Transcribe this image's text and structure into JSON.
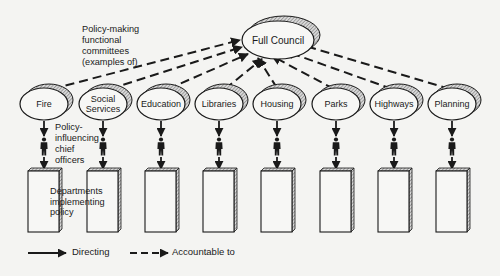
{
  "diagram": {
    "type": "organisation-chart",
    "council": {
      "label": "Full Council"
    },
    "committees_annotation": [
      "Policy-making",
      "functional",
      "committees",
      "(examples of)"
    ],
    "officers_annotation": [
      "Policy-",
      "influencing",
      "chief",
      "officers"
    ],
    "departments_annotation": [
      "Departments",
      "implementing",
      "policy"
    ],
    "committees": [
      {
        "label": "Fire",
        "lines": [
          "Fire"
        ]
      },
      {
        "label": "Social Services",
        "lines": [
          "Social",
          "Services"
        ]
      },
      {
        "label": "Education",
        "lines": [
          "Education"
        ]
      },
      {
        "label": "Libraries",
        "lines": [
          "Libraries"
        ]
      },
      {
        "label": "Housing",
        "lines": [
          "Housing"
        ]
      },
      {
        "label": "Parks",
        "lines": [
          "Parks"
        ]
      },
      {
        "label": "Highways",
        "lines": [
          "Highways"
        ]
      },
      {
        "label": "Planning",
        "lines": [
          "Planning"
        ]
      }
    ],
    "edges": {
      "committee_to_council": "Accountable to",
      "committee_to_officer_to_department": "Directing"
    },
    "legend": {
      "directing": "Directing",
      "accountable": "Accountable to"
    },
    "colors": {
      "ink": "#1a1a1a",
      "paper": "#f4f4f2",
      "hatch": "#9a9a9a"
    }
  }
}
